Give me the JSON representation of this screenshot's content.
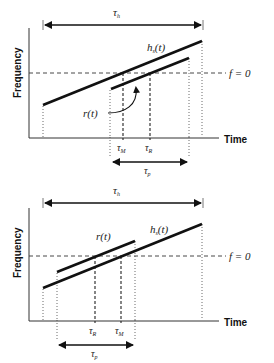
{
  "panels": [
    {
      "id": "top",
      "y_axis_label": "Frequency",
      "x_axis_label": "Time",
      "zero_line_label": "f = 0",
      "span_top_label": "τ",
      "span_top_sub": "h",
      "signal_label": "h",
      "signal_label_sub": "s",
      "signal_label_arg": "(t)",
      "reference_label": "r(t)",
      "marker_1": {
        "base": "τ",
        "sub": "M"
      },
      "marker_2": {
        "base": "τ",
        "sub": "R"
      },
      "span_bottom_label": "τ",
      "span_bottom_sub": "p"
    },
    {
      "id": "bottom",
      "y_axis_label": "Frequency",
      "x_axis_label": "Time",
      "zero_line_label": "f = 0",
      "span_top_label": "τ",
      "span_top_sub": "h",
      "signal_label": "h",
      "signal_label_sub": "s",
      "signal_label_arg": "(t)",
      "reference_label": "r(t)",
      "marker_1": {
        "base": "τ",
        "sub": "R"
      },
      "marker_2": {
        "base": "τ",
        "sub": "M"
      },
      "span_bottom_label": "τ",
      "span_bottom_sub": "p"
    }
  ],
  "colors": {
    "line": "#111111",
    "guide": "#333333"
  }
}
